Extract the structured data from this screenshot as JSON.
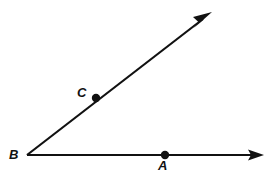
{
  "figure": {
    "background_color": "#ffffff",
    "stroke_color": "#111111",
    "stroke_width": 2,
    "width": 269,
    "height": 177,
    "vertex": {
      "name": "B",
      "label": "B",
      "x": 27,
      "y": 155
    },
    "rays": [
      {
        "name": "ray-BA",
        "from": "B",
        "through": "A",
        "start": {
          "x": 27,
          "y": 155
        },
        "end": {
          "x": 262,
          "y": 155
        },
        "arrowhead": "end",
        "direction": "right"
      },
      {
        "name": "ray-BC",
        "from": "B",
        "through": "C",
        "start": {
          "x": 27,
          "y": 155
        },
        "end": {
          "x": 211,
          "y": 13
        },
        "arrowhead": "end",
        "direction": "up-right"
      }
    ],
    "points": [
      {
        "name": "A",
        "label": "A",
        "x": 165,
        "y": 155,
        "dot_radius": 4,
        "label_x": 163,
        "label_y": 166,
        "label_position": "below"
      },
      {
        "name": "B",
        "label": "B",
        "x": 27,
        "y": 155,
        "dot_radius": 0,
        "label_x": 14,
        "label_y": 155,
        "label_position": "left"
      },
      {
        "name": "C",
        "label": "C",
        "x": 96,
        "y": 98,
        "dot_radius": 4,
        "label_x": 82,
        "label_y": 93,
        "label_position": "upper-left"
      }
    ]
  }
}
